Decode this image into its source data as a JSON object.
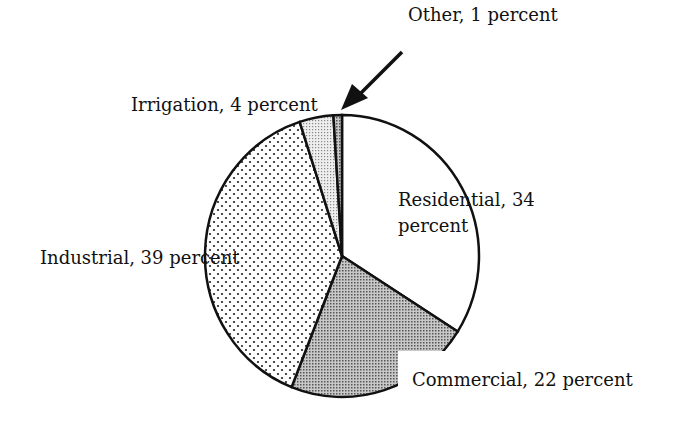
{
  "chart_data": {
    "type": "pie",
    "title": "",
    "slices": [
      {
        "label": "Residential",
        "value": 34,
        "unit": "percent"
      },
      {
        "label": "Commercial",
        "value": 22,
        "unit": "percent"
      },
      {
        "label": "Industrial",
        "value": 39,
        "unit": "percent"
      },
      {
        "label": "Irrigation",
        "value": 4,
        "unit": "percent"
      },
      {
        "label": "Other",
        "value": 1,
        "unit": "percent"
      }
    ]
  },
  "labels": {
    "residential_1": "Residential, 34",
    "residential_2": "percent",
    "commercial": "Commercial, 22 percent",
    "industrial": "Industrial, 39 percent",
    "irrigation": "Irrigation, 4 percent",
    "other": "Other, 1 percent"
  }
}
